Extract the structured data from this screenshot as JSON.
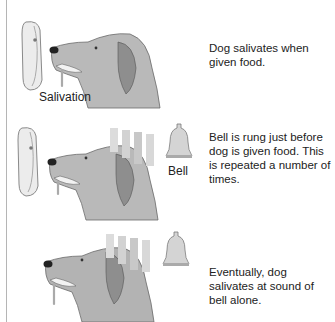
{
  "figure": {
    "panels": [
      {
        "caption": "Dog salivates when given food.",
        "labels": {
          "salivation": "Salivation"
        }
      },
      {
        "caption": "Bell is rung just before dog is given food. This is repeated a number of times.",
        "labels": {
          "bell": "Bell"
        }
      },
      {
        "caption": "Eventually, dog salivates at sound of bell alone."
      }
    ]
  }
}
